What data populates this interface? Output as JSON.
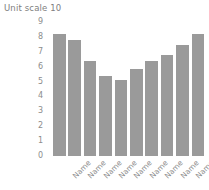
{
  "chart_data": {
    "type": "bar",
    "title": "Unit scale 10",
    "subtitle": "",
    "xlabel": "",
    "ylabel": "",
    "categories": [
      "Name",
      "Name",
      "Name",
      "Name",
      "Name",
      "Name",
      "Name",
      "Name",
      "Name",
      "Name"
    ],
    "values": [
      8.2,
      7.8,
      6.35,
      5.4,
      5.1,
      5.85,
      6.35,
      6.8,
      7.45,
      8.2
    ],
    "ylim": [
      0,
      9
    ],
    "ytick_labels": [
      "9",
      "8",
      "7",
      "6",
      "5",
      "4",
      "3",
      "2",
      "1",
      "0"
    ],
    "ytick_values": [
      9,
      8,
      7,
      6,
      5,
      4,
      3,
      2,
      1,
      0
    ],
    "grid": false,
    "legend": false,
    "legend_position": "none",
    "bar_color": "#9a9a9a",
    "text_color": "#8c8c8c",
    "title_color": "#7e7e7e",
    "background_color": "#ffffff",
    "xtick_rotation": -45
  }
}
